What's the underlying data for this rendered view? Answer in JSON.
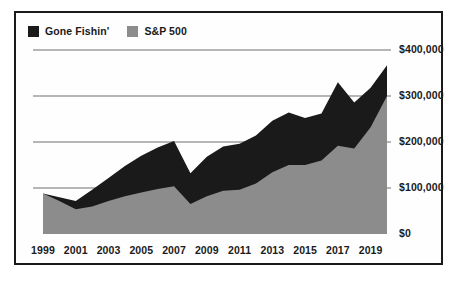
{
  "legend": {
    "position": "top-left",
    "entries": [
      {
        "label": "Gone Fishin'",
        "color": "#1a1a1a",
        "swatch_name": "legend-swatch-gone-fishin"
      },
      {
        "label": "S&P 500",
        "color": "#8c8c8c",
        "swatch_name": "legend-swatch-sp500"
      }
    ]
  },
  "axes": {
    "y_ticks": [
      "$0",
      "$100,000",
      "$200,000",
      "$300,000",
      "$400,000"
    ],
    "x_ticks": [
      "1999",
      "2001",
      "2003",
      "2005",
      "2007",
      "2009",
      "2011",
      "2013",
      "2015",
      "2017",
      "2019"
    ]
  },
  "colors": {
    "gone_fishin": "#1a1a1a",
    "sp500": "#8c8c8c",
    "gridline": "#6f6f6f",
    "frame": "#1a1a1a",
    "background": "#fefefe",
    "text": "#1a1a1a"
  },
  "chart_data": {
    "type": "area",
    "title": "",
    "subtitle": "",
    "xlabel": "",
    "ylabel": "",
    "grid": true,
    "legend_position": "top-left",
    "stacked": false,
    "xlim": [
      1999,
      2020
    ],
    "ylim": [
      0,
      400000
    ],
    "y_tick_values": [
      0,
      100000,
      200000,
      300000,
      400000
    ],
    "y_tick_labels": [
      "$0",
      "$100,000",
      "$200,000",
      "$300,000",
      "$400,000"
    ],
    "x": [
      1999,
      2000,
      2001,
      2002,
      2003,
      2004,
      2005,
      2006,
      2007,
      2008,
      2009,
      2010,
      2011,
      2012,
      2013,
      2014,
      2015,
      2016,
      2017,
      2018,
      2019,
      2020
    ],
    "x_tick_values": [
      1999,
      2001,
      2003,
      2005,
      2007,
      2009,
      2011,
      2013,
      2015,
      2017,
      2019
    ],
    "x_tick_labels": [
      "1999",
      "2001",
      "2003",
      "2005",
      "2007",
      "2009",
      "2011",
      "2013",
      "2015",
      "2017",
      "2019"
    ],
    "series": [
      {
        "name": "Gone Fishin'",
        "color": "#1a1a1a",
        "values": [
          88000,
          80000,
          72000,
          96000,
          122000,
          148000,
          170000,
          188000,
          202000,
          132000,
          168000,
          190000,
          196000,
          214000,
          246000,
          264000,
          252000,
          262000,
          330000,
          286000,
          318000,
          367000
        ]
      },
      {
        "name": "S&P 500",
        "color": "#8c8c8c",
        "values": [
          88000,
          72000,
          54000,
          60000,
          72000,
          82000,
          90000,
          98000,
          104000,
          65000,
          82000,
          94000,
          96000,
          110000,
          134000,
          150000,
          150000,
          160000,
          192000,
          186000,
          232000,
          300000
        ]
      }
    ]
  }
}
